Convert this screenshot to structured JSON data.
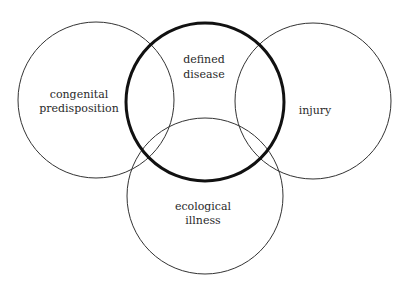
{
  "diagram": {
    "type": "venn",
    "circles": [
      {
        "id": "congenital",
        "lines": [
          "congenital",
          "predisposition"
        ],
        "emphasis": false
      },
      {
        "id": "defined_disease",
        "lines": [
          "defined",
          "disease"
        ],
        "emphasis": true
      },
      {
        "id": "injury",
        "lines": [
          "injury"
        ],
        "emphasis": false
      },
      {
        "id": "ecological",
        "lines": [
          "ecological",
          "illness"
        ],
        "emphasis": false
      }
    ]
  },
  "colors": {
    "background": "#ffffff",
    "stroke": "#333333",
    "emphasis_stroke": "#111111",
    "text": "#2a2a2a"
  }
}
